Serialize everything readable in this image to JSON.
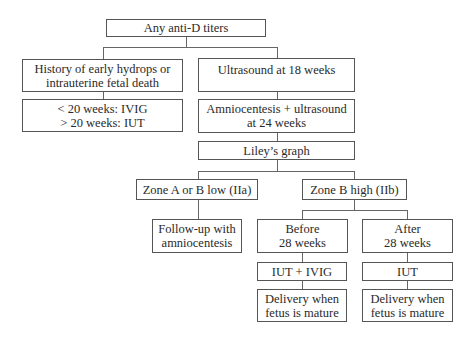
{
  "diagram": {
    "type": "flowchart",
    "nodes": {
      "root": {
        "lines": [
          "Any anti-D titers"
        ]
      },
      "history": {
        "lines": [
          "History of early hydrops or",
          "intrauterine fetal death"
        ]
      },
      "history_tx": {
        "lines": [
          "< 20 weeks: IVIG",
          "> 20 weeks: IUT"
        ]
      },
      "us18": {
        "lines": [
          "Ultrasound at 18 weeks"
        ]
      },
      "amnio24": {
        "lines": [
          "Amniocentesis + ultrasound",
          "at 24 weeks"
        ]
      },
      "liley": {
        "lines": [
          "Liley’s graph"
        ]
      },
      "zone_low": {
        "lines": [
          "Zone A or B low (IIa)"
        ]
      },
      "zone_high": {
        "lines": [
          "Zone B high (IIb)"
        ]
      },
      "followup": {
        "lines": [
          "Follow-up with",
          "amniocentesis"
        ]
      },
      "before28": {
        "lines": [
          "Before",
          "28 weeks"
        ]
      },
      "after28": {
        "lines": [
          "After",
          "28 weeks"
        ]
      },
      "iut_ivig": {
        "lines": [
          "IUT + IVIG"
        ]
      },
      "iut": {
        "lines": [
          "IUT"
        ]
      },
      "delivery_before": {
        "lines": [
          "Delivery when",
          "fetus is mature"
        ]
      },
      "delivery_after": {
        "lines": [
          "Delivery when",
          "fetus is mature"
        ]
      }
    },
    "edges": [
      [
        "root",
        "history"
      ],
      [
        "root",
        "us18"
      ],
      [
        "history",
        "history_tx"
      ],
      [
        "us18",
        "amnio24"
      ],
      [
        "amnio24",
        "liley"
      ],
      [
        "liley",
        "zone_low"
      ],
      [
        "liley",
        "zone_high"
      ],
      [
        "zone_low",
        "followup"
      ],
      [
        "zone_high",
        "before28"
      ],
      [
        "zone_high",
        "after28"
      ],
      [
        "before28",
        "iut_ivig"
      ],
      [
        "iut_ivig",
        "delivery_before"
      ],
      [
        "after28",
        "iut"
      ],
      [
        "iut",
        "delivery_after"
      ]
    ]
  }
}
